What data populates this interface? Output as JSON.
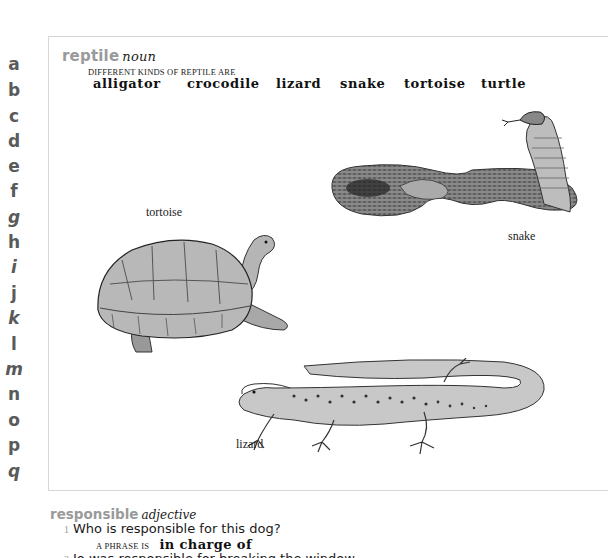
{
  "alphabet": [
    {
      "letter": "a",
      "top": 54
    },
    {
      "letter": "b",
      "top": 80
    },
    {
      "letter": "c",
      "top": 106
    },
    {
      "letter": "d",
      "top": 131
    },
    {
      "letter": "e",
      "top": 156
    },
    {
      "letter": "f",
      "top": 181
    },
    {
      "letter": "g",
      "top": 207
    },
    {
      "letter": "h",
      "top": 232
    },
    {
      "letter": "i",
      "top": 257
    },
    {
      "letter": "j",
      "top": 283
    },
    {
      "letter": "k",
      "top": 308
    },
    {
      "letter": "l",
      "top": 334
    },
    {
      "letter": "m",
      "top": 359
    },
    {
      "letter": "n",
      "top": 384
    },
    {
      "letter": "o",
      "top": 410
    },
    {
      "letter": "p",
      "top": 435
    },
    {
      "letter": "q",
      "top": 461
    }
  ],
  "reptile_entry": {
    "headword": "reptile",
    "part_of_speech": "noun",
    "kinds_label": "DIFFERENT KINDS OF REPTILE ARE",
    "kinds": [
      "alligator",
      "crocodile",
      "lizard",
      "snake",
      "tortoise",
      "turtle"
    ],
    "illustrations": [
      {
        "label": "tortoise",
        "icon": "tortoise-illustration"
      },
      {
        "label": "snake",
        "icon": "cobra-snake-illustration"
      },
      {
        "label": "lizard",
        "icon": "lizard-illustration"
      }
    ]
  },
  "responsible_entry": {
    "headword": "responsible",
    "part_of_speech": "adjective",
    "senses": [
      {
        "number": "1",
        "text": "Who is responsible for this dog?",
        "phrase_label": "A PHRASE IS",
        "phrase": "in charge of"
      },
      {
        "number": "2",
        "text": "Jo was responsible for breaking the window."
      }
    ]
  },
  "colors": {
    "headword": "#9a9a9a",
    "alphabet": "#5a5a5a",
    "panel_border": "#d6d6d6",
    "text": "#1a1a1a"
  }
}
